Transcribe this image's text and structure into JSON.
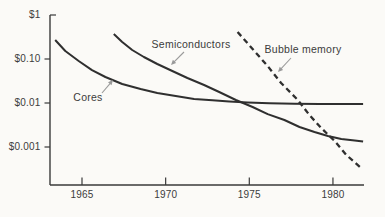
{
  "chart_data": {
    "type": "line",
    "title": "",
    "xlabel": "",
    "ylabel": "",
    "y_scale": "log",
    "grid": false,
    "legend": "inline-annotations",
    "x_range_years": [
      1963.1,
      1981.9
    ],
    "y_range_dollars": [
      0.00013,
      1.0
    ],
    "x_ticks": [
      {
        "year": 1965,
        "label": "1965"
      },
      {
        "year": 1970,
        "label": "1970"
      },
      {
        "year": 1975,
        "label": "1975"
      },
      {
        "year": 1980,
        "label": "1980"
      }
    ],
    "y_ticks": [
      {
        "value": 1,
        "label": "$1"
      },
      {
        "value": 0.1,
        "label": "$0.10"
      },
      {
        "value": 0.01,
        "label": "$0.01"
      },
      {
        "value": 0.001,
        "label": "$0.001"
      }
    ],
    "series": [
      {
        "name": "Cores",
        "style": "solid",
        "points": [
          [
            1963.4,
            0.27
          ],
          [
            1964.0,
            0.152
          ],
          [
            1964.8,
            0.09
          ],
          [
            1965.6,
            0.056
          ],
          [
            1966.4,
            0.039
          ],
          [
            1967.4,
            0.027
          ],
          [
            1968.5,
            0.0208
          ],
          [
            1969.5,
            0.0169
          ],
          [
            1970.6,
            0.0144
          ],
          [
            1971.7,
            0.0123
          ],
          [
            1972.8,
            0.0115
          ],
          [
            1973.8,
            0.0109
          ],
          [
            1974.9,
            0.0103
          ],
          [
            1976.2,
            0.0099
          ],
          [
            1977.7,
            0.0096
          ],
          [
            1979.2,
            0.0095
          ],
          [
            1980.7,
            0.0095
          ],
          [
            1981.8,
            0.0095
          ]
        ]
      },
      {
        "name": "Semiconductors",
        "style": "solid",
        "points": [
          [
            1966.9,
            0.37
          ],
          [
            1967.4,
            0.243
          ],
          [
            1968.0,
            0.16
          ],
          [
            1968.7,
            0.111
          ],
          [
            1969.5,
            0.077
          ],
          [
            1970.4,
            0.0533
          ],
          [
            1971.3,
            0.037
          ],
          [
            1972.3,
            0.0257
          ],
          [
            1973.2,
            0.0178
          ],
          [
            1974.2,
            0.0117
          ],
          [
            1975.2,
            0.0081
          ],
          [
            1976.1,
            0.0056
          ],
          [
            1977.1,
            0.0041
          ],
          [
            1978.0,
            0.00285
          ],
          [
            1978.9,
            0.00219
          ],
          [
            1979.7,
            0.00178
          ],
          [
            1980.5,
            0.00152
          ],
          [
            1981.3,
            0.00141
          ],
          [
            1981.8,
            0.00133
          ]
        ]
      },
      {
        "name": "Bubble memory",
        "style": "dashed",
        "points": [
          [
            1974.3,
            0.41
          ],
          [
            1975.2,
            0.169
          ],
          [
            1976.1,
            0.069
          ],
          [
            1976.9,
            0.0285
          ],
          [
            1977.9,
            0.0117
          ],
          [
            1978.6,
            0.0053
          ],
          [
            1979.3,
            0.0027
          ],
          [
            1980.1,
            0.00137
          ],
          [
            1980.8,
            0.00066
          ],
          [
            1981.7,
            0.00033
          ]
        ]
      }
    ],
    "annotations": [
      {
        "text": "Cores",
        "text_px": [
          88,
          98
        ],
        "arrow_from_px": [
          102,
          93
        ],
        "arrow_to_px": [
          113,
          80
        ]
      },
      {
        "text": "Semiconductors",
        "text_px": [
          191,
          45
        ],
        "arrow_from_px": [
          184,
          52
        ],
        "arrow_to_px": [
          171,
          65
        ]
      },
      {
        "text": "Bubble memory",
        "text_px": [
          303,
          50
        ],
        "arrow_from_px": [
          291,
          58
        ],
        "arrow_to_px": [
          278,
          72
        ]
      }
    ]
  },
  "colors": {
    "stroke": "#2f2f2f",
    "axis": "#3a3a3a",
    "text": "#3c3c3c",
    "arrow": "#9a9a9a",
    "background": "#fbfaf7"
  }
}
